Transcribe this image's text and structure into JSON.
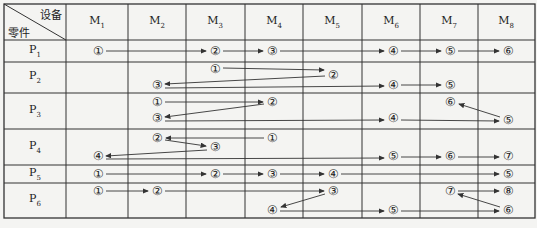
{
  "header": {
    "corner_top": "设备",
    "corner_bottom": "零件",
    "machines": [
      "M1",
      "M2",
      "M3",
      "M4",
      "M5",
      "M6",
      "M7",
      "M8"
    ]
  },
  "parts": [
    "P1",
    "P2",
    "P3",
    "P4",
    "P5",
    "P6"
  ],
  "colors": {
    "line": "#333333",
    "background": "#f4f4f2"
  },
  "routes": [
    {
      "part": "P1",
      "nodes": [
        {
          "label": "①",
          "x": 98,
          "y": 51
        },
        {
          "label": "②",
          "x": 215,
          "y": 51
        },
        {
          "label": "③",
          "x": 272,
          "y": 51
        },
        {
          "label": "④",
          "x": 393,
          "y": 51
        },
        {
          "label": "⑤",
          "x": 450,
          "y": 51
        },
        {
          "label": "⑥",
          "x": 508,
          "y": 51
        }
      ]
    },
    {
      "part": "P2",
      "nodes": [
        {
          "label": "①",
          "x": 215,
          "y": 69
        },
        {
          "label": "②",
          "x": 333,
          "y": 75
        },
        {
          "label": "③",
          "x": 157,
          "y": 85
        },
        {
          "label": "④",
          "x": 393,
          "y": 85
        },
        {
          "label": "⑤",
          "x": 450,
          "y": 85
        }
      ]
    },
    {
      "part": "P3",
      "nodes": [
        {
          "label": "①",
          "x": 157,
          "y": 102
        },
        {
          "label": "②",
          "x": 272,
          "y": 102
        },
        {
          "label": "③",
          "x": 157,
          "y": 118
        },
        {
          "label": "④",
          "x": 393,
          "y": 118
        },
        {
          "label": "⑤",
          "x": 508,
          "y": 120
        },
        {
          "label": "⑥",
          "x": 450,
          "y": 102
        }
      ]
    },
    {
      "part": "P4",
      "nodes": [
        {
          "label": "①",
          "x": 272,
          "y": 138
        },
        {
          "label": "②",
          "x": 157,
          "y": 138
        },
        {
          "label": "③",
          "x": 215,
          "y": 147
        },
        {
          "label": "④",
          "x": 98,
          "y": 156
        },
        {
          "label": "⑤",
          "x": 393,
          "y": 156
        },
        {
          "label": "⑥",
          "x": 450,
          "y": 156
        },
        {
          "label": "⑦",
          "x": 508,
          "y": 156
        }
      ]
    },
    {
      "part": "P5",
      "nodes": [
        {
          "label": "①",
          "x": 98,
          "y": 174
        },
        {
          "label": "②",
          "x": 215,
          "y": 174
        },
        {
          "label": "③",
          "x": 272,
          "y": 174
        },
        {
          "label": "④",
          "x": 333,
          "y": 174
        },
        {
          "label": "⑤",
          "x": 508,
          "y": 174
        }
      ]
    },
    {
      "part": "P6",
      "nodes": [
        {
          "label": "①",
          "x": 98,
          "y": 191
        },
        {
          "label": "②",
          "x": 157,
          "y": 191
        },
        {
          "label": "③",
          "x": 333,
          "y": 191
        },
        {
          "label": "④",
          "x": 272,
          "y": 210
        },
        {
          "label": "⑤",
          "x": 393,
          "y": 210
        },
        {
          "label": "⑥",
          "x": 508,
          "y": 210
        },
        {
          "label": "⑦",
          "x": 450,
          "y": 191
        },
        {
          "label": "⑧",
          "x": 508,
          "y": 191
        }
      ]
    }
  ]
}
